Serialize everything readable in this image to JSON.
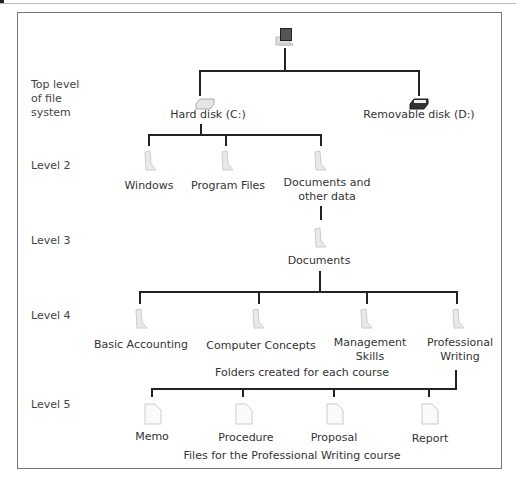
{
  "levels": {
    "top": "Top level\nof file\nsystem",
    "level2": "Level 2",
    "level3": "Level 3",
    "level4": "Level 4",
    "level5": "Level 5"
  },
  "root": {
    "icon": "computer-icon"
  },
  "drives": [
    {
      "label": "Hard disk (C:)",
      "icon": "hard-disk-icon"
    },
    {
      "label": "Removable disk (D:)",
      "icon": "removable-disk-icon"
    }
  ],
  "level2": [
    {
      "label": "Windows",
      "icon": "folder-icon"
    },
    {
      "label": "Program Files",
      "icon": "folder-icon"
    },
    {
      "label": "Documents and\nother data",
      "icon": "folder-icon"
    }
  ],
  "level3": [
    {
      "label": "Documents",
      "icon": "folder-icon"
    }
  ],
  "level4": [
    {
      "label": "Basic Accounting",
      "icon": "folder-icon"
    },
    {
      "label": "Computer Concepts",
      "icon": "folder-icon"
    },
    {
      "label": "Management\nSkills",
      "icon": "folder-icon"
    },
    {
      "label": "Professional\nWriting",
      "icon": "folder-icon"
    }
  ],
  "level4_caption": "Folders created for each course",
  "level5": [
    {
      "label": "Memo",
      "icon": "file-icon"
    },
    {
      "label": "Procedure",
      "icon": "file-icon"
    },
    {
      "label": "Proposal",
      "icon": "file-icon"
    },
    {
      "label": "Report",
      "icon": "file-icon"
    }
  ],
  "level5_caption": "Files for the Professional Writing course"
}
